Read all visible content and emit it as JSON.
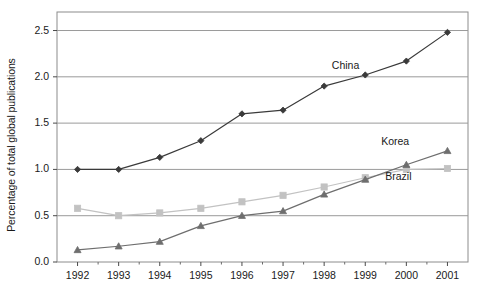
{
  "chart_data": {
    "type": "line",
    "title": "",
    "subtitle": "",
    "xlabel": "",
    "ylabel": "Percentage of total global publications",
    "x": [
      1992,
      1993,
      1994,
      1995,
      1996,
      1997,
      1998,
      1999,
      2000,
      2001
    ],
    "categories": [
      "1992",
      "1993",
      "1994",
      "1995",
      "1996",
      "1997",
      "1998",
      "1999",
      "2000",
      "2001"
    ],
    "xlim": [
      1991.5,
      2001.5
    ],
    "ylim": [
      0.0,
      2.7
    ],
    "yticks": [
      0.0,
      0.5,
      1.0,
      1.5,
      2.0,
      2.5
    ],
    "ytick_labels": [
      "0.0",
      "0.5",
      "1.0",
      "1.5",
      "2.0",
      "2.5"
    ],
    "grid": "horizontal",
    "legend_position": "inline-annotations",
    "series": [
      {
        "name": "China",
        "color": "#3a3a3a",
        "marker": "diamond",
        "values": [
          1.0,
          1.0,
          1.13,
          1.31,
          1.6,
          1.64,
          1.9,
          2.02,
          2.17,
          2.48
        ]
      },
      {
        "name": "Korea",
        "color": "#6e6e6e",
        "marker": "triangle",
        "values": [
          0.13,
          0.17,
          0.22,
          0.39,
          0.5,
          0.55,
          0.73,
          0.89,
          1.05,
          1.2
        ]
      },
      {
        "name": "Brazil",
        "color": "#c2c2c2",
        "marker": "square",
        "values": [
          0.58,
          0.5,
          0.53,
          0.58,
          0.65,
          0.72,
          0.81,
          0.91,
          1.0,
          1.01
        ]
      }
    ],
    "annotations": [
      {
        "text": "China",
        "x": 1998.6,
        "y": 2.12
      },
      {
        "text": "Korea",
        "x": 1999.8,
        "y": 1.3
      },
      {
        "text": "Brazil",
        "x": 1999.9,
        "y": 0.92
      }
    ]
  }
}
